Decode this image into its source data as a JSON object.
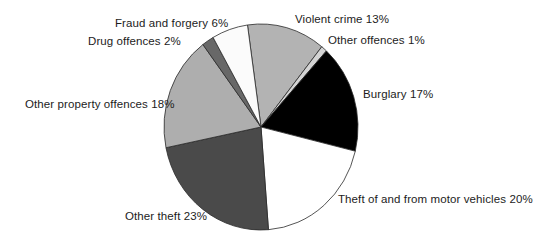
{
  "page": {
    "background": "#ffffff",
    "title": ""
  },
  "chart_data": {
    "type": "pie",
    "title": "",
    "legend_position": "none",
    "labels_style": "outside-callout-text",
    "start_angle_deg": -8,
    "direction": "clockwise",
    "stroke": "#2a2a2a",
    "center": {
      "x": 261,
      "y": 127
    },
    "radius": 100,
    "scale_x": 0.97,
    "scale_y": 1.03,
    "slices": [
      {
        "name": "Violent crime",
        "pct": 13,
        "label": "Violent crime 13%",
        "fill": "#b3b3b3"
      },
      {
        "name": "Other offences",
        "pct": 1,
        "label": "Other offences 1%",
        "fill": "#d4d4d4"
      },
      {
        "name": "Burglary",
        "pct": 17,
        "label": "Burglary 17%",
        "fill": "#000000"
      },
      {
        "name": "Theft of and from motor vehicles",
        "pct": 20,
        "label": "Theft of and from motor vehicles 20%",
        "fill": "#ffffff"
      },
      {
        "name": "Other theft",
        "pct": 23,
        "label": "Other theft 23%",
        "fill": "#4a4a4a"
      },
      {
        "name": "Other property offences",
        "pct": 18,
        "label": "Other property offences 18%",
        "fill": "#aeaeae"
      },
      {
        "name": "Drug offences",
        "pct": 2,
        "label": "Drug offences 2%",
        "fill": "#686868"
      },
      {
        "name": "Fraud and forgery",
        "pct": 6,
        "label": "Fraud and forgery 6%",
        "fill": "#fbfbfb"
      }
    ]
  }
}
